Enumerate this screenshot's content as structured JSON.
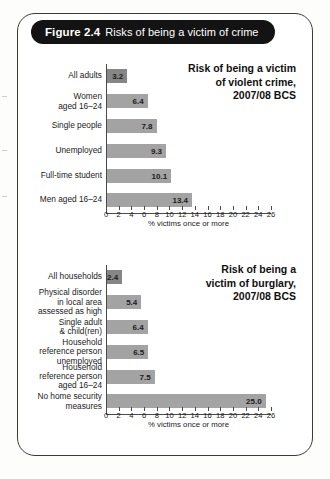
{
  "figure": {
    "number_label": "Figure 2.4",
    "caption": "Risks of being a victim of crime",
    "header_bg": "#131313",
    "header_text_color": "#ffffff",
    "border_color": "#3b3b3b"
  },
  "axis": {
    "tick_labels": [
      "0",
      "2",
      "4",
      "6",
      "8",
      "10",
      "12",
      "14",
      "16",
      "18",
      "20",
      "22",
      "24",
      "26"
    ],
    "title": "% victims once or more",
    "min": 0,
    "max": 26,
    "step": 2
  },
  "colors": {
    "bar": "#a3a3a3",
    "bar_highlight": "#868686",
    "axis": "#4a4a4a",
    "text": "#1b1b1b"
  },
  "chart_data": [
    {
      "id": "violent",
      "type": "bar",
      "orientation": "horizontal",
      "title": "Risk of being a victim of violent crime, 2007/08 BCS",
      "title_lines": [
        "Risk of being a victim",
        "of violent crime,",
        "2007/08 BCS"
      ],
      "xlabel": "% victims once or more",
      "ylabel": "",
      "xlim": [
        0,
        26
      ],
      "xticks": [
        0,
        2,
        4,
        6,
        8,
        10,
        12,
        14,
        16,
        18,
        20,
        22,
        24,
        26
      ],
      "grid": false,
      "legend": false,
      "categories": [
        "All adults",
        "Women aged 16–24",
        "Single people",
        "Unemployed",
        "Full-time student",
        "Men aged 16–24"
      ],
      "category_lines": [
        [
          "All adults"
        ],
        [
          "Women",
          "aged 16–24"
        ],
        [
          "Single people"
        ],
        [
          "Unemployed"
        ],
        [
          "Full-time student"
        ],
        [
          "Men aged 16–24"
        ]
      ],
      "values": [
        3.2,
        6.4,
        7.8,
        9.3,
        10.1,
        13.4
      ],
      "value_labels": [
        "3.2",
        "6.4",
        "7.8",
        "9.3",
        "10.1",
        "13.4"
      ]
    },
    {
      "id": "burglary",
      "type": "bar",
      "orientation": "horizontal",
      "title": "Risk of being a victim of burglary, 2007/08 BCS",
      "title_lines": [
        "Risk of being a",
        "victim of burglary,",
        "2007/08 BCS"
      ],
      "xlabel": "% victims once or more",
      "ylabel": "",
      "xlim": [
        0,
        26
      ],
      "xticks": [
        0,
        2,
        4,
        6,
        8,
        10,
        12,
        14,
        16,
        18,
        20,
        22,
        24,
        26
      ],
      "grid": false,
      "legend": false,
      "categories": [
        "All households",
        "Physical disorder in local area assessed as high",
        "Single adult & child(ren)",
        "Household reference person unemployed",
        "Household reference person aged 16–24",
        "No home security measures"
      ],
      "category_lines": [
        [
          "All households"
        ],
        [
          "Physical disorder",
          "in local area",
          "assessed as high"
        ],
        [
          "Single adult",
          "& child(ren)"
        ],
        [
          "Household",
          "reference person",
          "unemployed"
        ],
        [
          "Household",
          "reference person",
          "aged 16–24"
        ],
        [
          "No home security",
          "measures"
        ]
      ],
      "values": [
        2.4,
        5.4,
        6.4,
        6.5,
        7.5,
        25.0
      ],
      "value_labels": [
        "2.4",
        "5.4",
        "6.4",
        "6.5",
        "7.5",
        "25.0"
      ]
    }
  ]
}
